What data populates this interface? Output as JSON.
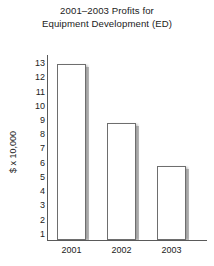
{
  "chart_data": {
    "type": "bar",
    "title": "2001–2003 Profits for Equipment Development (ED)",
    "title_lines": [
      "2001–2003 Profits for",
      "Equipment Development (ED)"
    ],
    "categories": [
      "2001",
      "2002",
      "2003"
    ],
    "values": [
      13,
      8.8,
      5.8
    ],
    "xlabel": "",
    "ylabel": "$ x 10,000",
    "ylim": [
      0.6,
      13.6
    ],
    "yticks": [
      13,
      12,
      11,
      10,
      9,
      8,
      7,
      6,
      5,
      4,
      3,
      2,
      1
    ],
    "ytick_labels": [
      "13",
      "12",
      "11",
      "10",
      "9",
      "8",
      "7",
      "6",
      "5",
      "4",
      "3",
      "2",
      "1"
    ],
    "grid": false,
    "legend": null,
    "bar_style": {
      "fill": "#ffffff",
      "edge": "#6e6e6e",
      "shadow": "#bdbdbd"
    },
    "axis_color": "#5a5a5a",
    "text_color": "#222222"
  }
}
